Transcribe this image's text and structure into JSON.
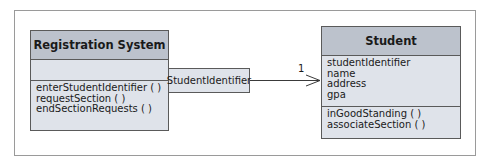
{
  "diagram": {
    "type": "UML class diagram (qualified association)",
    "classes": [
      {
        "name": "Registration System",
        "attributes": [],
        "operations": [
          "enterStudentIdentifier ( )",
          "requestSection ( )",
          "endSectionRequests ( )"
        ]
      },
      {
        "name": "Student",
        "attributes": [
          "studentIdentifier",
          "name",
          "address",
          "gpa"
        ],
        "operations": [
          "inGoodStanding ( )",
          "associateSection ( )"
        ]
      }
    ],
    "association": {
      "qualifier": "StudentIdentifier",
      "multiplicity": "1",
      "navigability": "Registration System to Student"
    }
  },
  "colors": {
    "header_fill": "#bcc2cc",
    "body_fill": "#dfe3ea",
    "border": "#5a5a5a",
    "frame": "#9a9a9a"
  }
}
